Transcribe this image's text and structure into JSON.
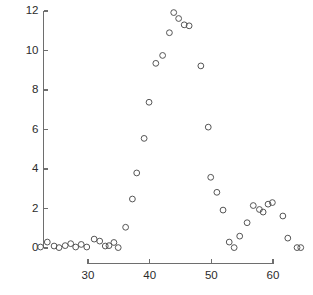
{
  "chart_data": {
    "type": "scatter",
    "title": "",
    "subtitle": "",
    "xlabel": "",
    "ylabel": "",
    "xlim": [
      21.5,
      65.5
    ],
    "ylim": [
      -0.4,
      12.2
    ],
    "xticks": [
      30,
      40,
      50,
      60
    ],
    "yticks": [
      0,
      2,
      4,
      6,
      8,
      10,
      12
    ],
    "xtick_labels": [
      "30",
      "40",
      "50",
      "60"
    ],
    "ytick_labels": [
      "0",
      "2",
      "4",
      "6",
      "8",
      "10",
      "12"
    ],
    "grid": false,
    "legend": null,
    "marker": "open-circle",
    "marker_color": "#555555",
    "points": [
      {
        "x": 22.3,
        "y": 0.05
      },
      {
        "x": 23.4,
        "y": 0.3
      },
      {
        "x": 24.5,
        "y": 0.1
      },
      {
        "x": 25.3,
        "y": 0.02
      },
      {
        "x": 26.3,
        "y": 0.12
      },
      {
        "x": 27.2,
        "y": 0.22
      },
      {
        "x": 28.0,
        "y": 0.05
      },
      {
        "x": 28.9,
        "y": 0.18
      },
      {
        "x": 29.8,
        "y": 0.05
      },
      {
        "x": 31.0,
        "y": 0.45
      },
      {
        "x": 31.9,
        "y": 0.35
      },
      {
        "x": 32.8,
        "y": 0.1
      },
      {
        "x": 33.4,
        "y": 0.12
      },
      {
        "x": 34.2,
        "y": 0.28
      },
      {
        "x": 34.9,
        "y": 0.02
      },
      {
        "x": 36.1,
        "y": 1.05
      },
      {
        "x": 37.2,
        "y": 2.48
      },
      {
        "x": 37.9,
        "y": 3.8
      },
      {
        "x": 39.1,
        "y": 5.55
      },
      {
        "x": 39.9,
        "y": 7.38
      },
      {
        "x": 41.0,
        "y": 9.35
      },
      {
        "x": 42.1,
        "y": 9.75
      },
      {
        "x": 43.2,
        "y": 10.9
      },
      {
        "x": 43.9,
        "y": 11.92
      },
      {
        "x": 44.7,
        "y": 11.62
      },
      {
        "x": 45.6,
        "y": 11.3
      },
      {
        "x": 46.4,
        "y": 11.25
      },
      {
        "x": 48.3,
        "y": 9.22
      },
      {
        "x": 49.5,
        "y": 6.12
      },
      {
        "x": 49.9,
        "y": 3.58
      },
      {
        "x": 50.9,
        "y": 2.82
      },
      {
        "x": 51.9,
        "y": 1.92
      },
      {
        "x": 52.9,
        "y": 0.3
      },
      {
        "x": 53.7,
        "y": 0.02
      },
      {
        "x": 54.6,
        "y": 0.6
      },
      {
        "x": 55.8,
        "y": 1.28
      },
      {
        "x": 56.8,
        "y": 2.15
      },
      {
        "x": 57.8,
        "y": 1.95
      },
      {
        "x": 58.4,
        "y": 1.82
      },
      {
        "x": 59.2,
        "y": 2.22
      },
      {
        "x": 59.9,
        "y": 2.3
      },
      {
        "x": 61.6,
        "y": 1.62
      },
      {
        "x": 62.4,
        "y": 0.5
      },
      {
        "x": 63.9,
        "y": 0.02
      },
      {
        "x": 64.5,
        "y": 0.02
      }
    ]
  }
}
